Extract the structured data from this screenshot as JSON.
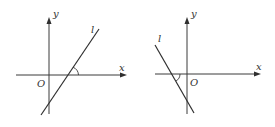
{
  "figures": [
    {
      "id": "left",
      "slope_sign": "positive",
      "angle_description": "acute angle of inclination between line l and positive x-axis",
      "labels": {
        "x_axis": "x",
        "y_axis": "y",
        "origin": "O",
        "line": "l"
      }
    },
    {
      "id": "right",
      "slope_sign": "negative",
      "angle_description": "obtuse angle of inclination between line l and positive x-axis",
      "labels": {
        "x_axis": "x",
        "y_axis": "y",
        "origin": "O",
        "line": "l"
      }
    }
  ],
  "colors": {
    "ink": "#2f2f2f",
    "background": "#ffffff"
  }
}
